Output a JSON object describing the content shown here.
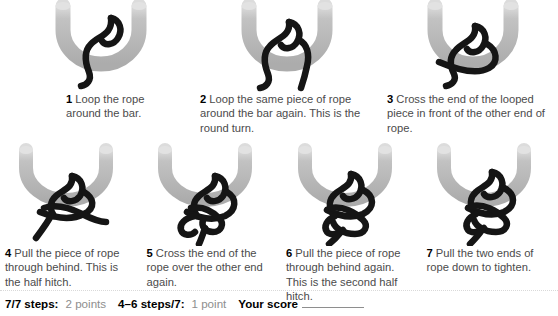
{
  "colors": {
    "bar_grey": "#b3b3b3",
    "bar_tip_light": "#d8d8d8",
    "rope_black": "#151515",
    "caption_text": "#4b4b4b",
    "number_text": "#000000",
    "score_muted": "#8e8e8e",
    "background": "#ffffff"
  },
  "steps": [
    {
      "number": "1",
      "text": "Loop the rope around the bar.",
      "figure_name": "knot-diagram-step-1"
    },
    {
      "number": "2",
      "text": "Loop the same piece of rope around the bar again. This is the round turn.",
      "figure_name": "knot-diagram-step-2"
    },
    {
      "number": "3",
      "text": "Cross the end of the looped piece in front of the other end of rope.",
      "figure_name": "knot-diagram-step-3"
    },
    {
      "number": "4",
      "text": "Pull the piece of rope through behind. This is the half hitch.",
      "figure_name": "knot-diagram-step-4"
    },
    {
      "number": "5",
      "text": "Cross the end of the rope over the other end again.",
      "figure_name": "knot-diagram-step-5"
    },
    {
      "number": "6",
      "text": "Pull the piece of rope through behind again. This is the second half hitch.",
      "figure_name": "knot-diagram-step-6"
    },
    {
      "number": "7",
      "text": "Pull the two ends of rope down to tighten.",
      "figure_name": "knot-diagram-step-7"
    }
  ],
  "score": {
    "criterion_full_label": "7/7 steps:",
    "criterion_full_value": "2 points",
    "criterion_partial_label": "4–6 steps/7:",
    "criterion_partial_value": "1 point",
    "your_score_label": "Your score",
    "your_score_value": ""
  }
}
